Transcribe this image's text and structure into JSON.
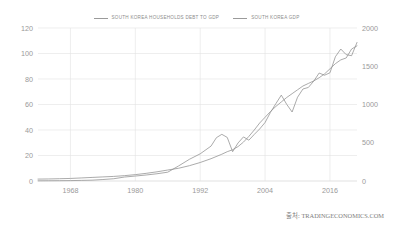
{
  "legend": {
    "items": [
      {
        "label": "SOUTH KOREA HOUSEHOLDS DEBT TO GDP",
        "color": "#9a9a9a",
        "icon": "line-swatch-icon"
      },
      {
        "label": "SOUTH KOREA GDP",
        "color": "#9a9a9a",
        "icon": "line-swatch-icon"
      }
    ]
  },
  "source": {
    "text": "출처: TRADINGECONOMICS.COM"
  },
  "colors": {
    "series": "#8f8f8f",
    "grid": "#e3e3e3",
    "text": "#9a9a9a",
    "background": "#ffffff"
  },
  "chart_data": {
    "type": "line",
    "title": "",
    "subtitle": "",
    "xlabel": "",
    "ylabel": "",
    "grid": true,
    "legend_position": "top-center",
    "xlim": [
      1962,
      2021
    ],
    "x_ticks": [
      1968,
      1980,
      1992,
      2004,
      2016
    ],
    "x_tick_labels": [
      "1968",
      "1980",
      "1992",
      "2004",
      "2016"
    ],
    "axes": [
      {
        "id": "left",
        "name": "SOUTH KOREA HOUSEHOLDS DEBT TO GDP",
        "ylim": [
          0,
          120
        ],
        "ticks": [
          0,
          20,
          40,
          60,
          80,
          100,
          120
        ],
        "tick_labels": [
          "0",
          "20",
          "40",
          "60",
          "80",
          "100",
          "120"
        ],
        "unit": "percent of GDP"
      },
      {
        "id": "right",
        "name": "SOUTH KOREA GDP",
        "ylim": [
          0,
          2000
        ],
        "ticks": [
          0,
          500,
          1000,
          1500,
          2000
        ],
        "tick_labels": [
          "0",
          "500",
          "1000",
          "1500",
          "2000"
        ],
        "unit": "USD Billion"
      }
    ],
    "series": [
      {
        "name": "SOUTH KOREA HOUSEHOLDS DEBT TO GDP",
        "axis": "left",
        "color": "#8f8f8f",
        "x": [
          1962,
          1964,
          1966,
          1968,
          1970,
          1972,
          1974,
          1976,
          1978,
          1980,
          1982,
          1984,
          1986,
          1988,
          1990,
          1992,
          1994,
          1996,
          1997,
          1998,
          1999,
          2000,
          2001,
          2002,
          2003,
          2004,
          2005,
          2006,
          2007,
          2008,
          2009,
          2010,
          2011,
          2012,
          2013,
          2014,
          2015,
          2016,
          2017,
          2018,
          2019,
          2020,
          2021
        ],
        "values": [
          1.5,
          1.6,
          1.8,
          2.0,
          2.4,
          2.8,
          3.2,
          3.6,
          4.2,
          5.0,
          6.0,
          7.2,
          8.6,
          10.0,
          12.0,
          14.5,
          17.5,
          21.0,
          23.0,
          24.5,
          27.0,
          30.5,
          35.0,
          40.0,
          45.5,
          50.0,
          54.5,
          58.5,
          62.0,
          65.5,
          68.5,
          71.5,
          74.5,
          76.5,
          78.5,
          81.0,
          84.0,
          88.0,
          92.0,
          95.0,
          96.5,
          103.5,
          106.0
        ]
      },
      {
        "name": "SOUTH KOREA GDP",
        "axis": "right",
        "color": "#8f8f8f",
        "x": [
          1962,
          1964,
          1966,
          1968,
          1970,
          1972,
          1974,
          1976,
          1978,
          1980,
          1982,
          1984,
          1986,
          1988,
          1990,
          1992,
          1994,
          1995,
          1996,
          1997,
          1998,
          1999,
          2000,
          2001,
          2002,
          2003,
          2004,
          2005,
          2006,
          2007,
          2008,
          2009,
          2010,
          2011,
          2012,
          2013,
          2014,
          2015,
          2016,
          2017,
          2018,
          2019,
          2020,
          2021
        ],
        "values": [
          2.4,
          3.1,
          3.9,
          5.2,
          8.1,
          10.8,
          19.4,
          29.5,
          51.7,
          64.9,
          78.3,
          94.7,
          115.3,
          196.7,
          283.4,
          355.3,
          455.9,
          566.6,
          610.2,
          569.7,
          383.3,
          497.2,
          576.2,
          533.4,
          609.0,
          680.5,
          764.9,
          898.1,
          1011.8,
          1122.7,
          1002.2,
          901.9,
          1094.5,
          1202.5,
          1222.8,
          1305.6,
          1411.3,
          1382.8,
          1414.8,
          1623.9,
          1725.2,
          1651.4,
          1637.9,
          1810.9
        ]
      }
    ],
    "annotations": [
      {
        "text": "1998 Asian financial crisis GDP contraction",
        "x": 1998
      },
      {
        "text": "2009 global financial crisis GDP dip",
        "x": 2009
      },
      {
        "text": "2020 COVID-19 GDP dip with debt-to-GDP spike",
        "x": 2020
      }
    ]
  }
}
